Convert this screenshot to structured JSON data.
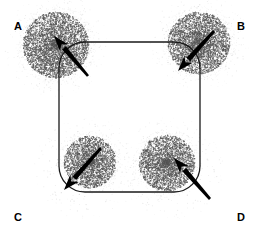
{
  "figure": {
    "background_color": "#ffffff",
    "stroke_color": "#1a1a1a",
    "stipple_color": "#555555",
    "arrow_color": "#000000",
    "width": 262,
    "height": 243
  },
  "labels": [
    {
      "id": "A",
      "text": "A",
      "corner": "top-left"
    },
    {
      "id": "B",
      "text": "B",
      "corner": "top-right"
    },
    {
      "id": "C",
      "text": "C",
      "corner": "bottom-left"
    },
    {
      "id": "D",
      "text": "D",
      "corner": "bottom-right"
    }
  ],
  "shape": {
    "name": "rounded-square",
    "x": 59,
    "y": 42,
    "width": 141,
    "height": 150,
    "corner_radius": 26,
    "stroke_width": 1.3
  },
  "stipple_regions": [
    {
      "id": "A",
      "cx": 56,
      "cy": 45,
      "r": 33,
      "density": "high"
    },
    {
      "id": "B",
      "cx": 199,
      "cy": 43,
      "r": 31,
      "density": "high"
    },
    {
      "id": "C",
      "cx": 90,
      "cy": 162,
      "r": 26,
      "density": "high"
    },
    {
      "id": "D",
      "cx": 167,
      "cy": 163,
      "r": 28,
      "density": "high"
    }
  ],
  "stipple_halos": [
    {
      "id": "A-halo",
      "cx": 56,
      "cy": 45,
      "r": 52,
      "density": "low"
    },
    {
      "id": "B-halo",
      "cx": 199,
      "cy": 43,
      "r": 50,
      "density": "low"
    },
    {
      "id": "C-halo",
      "cx": 86,
      "cy": 168,
      "r": 52,
      "density": "low"
    },
    {
      "id": "D-halo",
      "cx": 171,
      "cy": 169,
      "r": 52,
      "density": "low"
    }
  ],
  "arrows": [
    {
      "id": "A",
      "tail_x": 88,
      "tail_y": 76,
      "head_x": 54,
      "head_y": 36,
      "direction": "up-left",
      "shaft_width": 3.2
    },
    {
      "id": "B",
      "tail_x": 214,
      "tail_y": 31,
      "head_x": 178,
      "head_y": 71,
      "direction": "down-left",
      "shaft_width": 3.2
    },
    {
      "id": "C",
      "tail_x": 101,
      "tail_y": 148,
      "head_x": 64,
      "head_y": 190,
      "direction": "down-left",
      "shaft_width": 3.2
    },
    {
      "id": "D",
      "tail_x": 210,
      "tail_y": 199,
      "head_x": 174,
      "head_y": 158,
      "direction": "up-left",
      "shaft_width": 3.2
    }
  ]
}
